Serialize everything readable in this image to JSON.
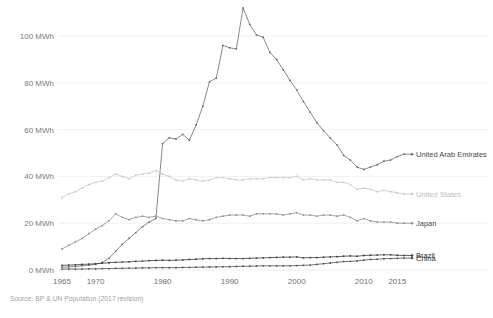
{
  "chart_data": {
    "type": "line",
    "title": "",
    "subtitle": "",
    "xlabel": "",
    "ylabel": "",
    "unit": "MWh",
    "xlim": [
      1965,
      2016
    ],
    "ylim": [
      0,
      112
    ],
    "grid": true,
    "legend_position": "right-inline",
    "source": "Source: BP & UN Population (2017 revision)",
    "y_ticks": [
      0,
      20,
      40,
      60,
      80,
      100
    ],
    "y_tick_labels": [
      "0 MWh",
      "20 MWh",
      "40 MWh",
      "60 MWh",
      "80 MWh",
      "100 MWh"
    ],
    "x_ticks": [
      1965,
      1970,
      1980,
      1990,
      2000,
      2010,
      2015
    ],
    "x_tick_labels": [
      "1965",
      "1970",
      "1980",
      "1990",
      "2000",
      "2010",
      "2015"
    ],
    "x": [
      1965,
      1966,
      1967,
      1968,
      1969,
      1970,
      1971,
      1972,
      1973,
      1974,
      1975,
      1976,
      1977,
      1978,
      1979,
      1980,
      1981,
      1982,
      1983,
      1984,
      1985,
      1986,
      1987,
      1988,
      1989,
      1990,
      1991,
      1992,
      1993,
      1994,
      1995,
      1996,
      1997,
      1998,
      1999,
      2000,
      2001,
      2002,
      2003,
      2004,
      2005,
      2006,
      2007,
      2008,
      2009,
      2010,
      2011,
      2012,
      2013,
      2014,
      2015,
      2016
    ],
    "series": [
      {
        "name": "United Arab Emirates",
        "color": "#6b6b6b",
        "label_color": "#4a4a4a",
        "values": [
          1.2,
          1.3,
          1.5,
          1.8,
          2.1,
          2.4,
          3.2,
          5.0,
          8.0,
          11.0,
          13.5,
          16.0,
          18.5,
          20.5,
          22.0,
          54.0,
          56.5,
          56.0,
          58.0,
          55.5,
          62.0,
          70.0,
          80.5,
          82.0,
          96.0,
          95.0,
          94.5,
          112.0,
          105.0,
          100.5,
          99.5,
          93.0,
          90.0,
          85.5,
          81.0,
          77.0,
          72.0,
          67.5,
          63.0,
          59.5,
          56.5,
          53.5,
          49.0,
          47.0,
          44.0,
          43.0,
          44.0,
          45.0,
          46.5,
          47.0,
          48.5,
          49.5
        ]
      },
      {
        "name": "United States",
        "color": "#c8c8c8",
        "label_color": "#c0c0c0",
        "values": [
          31.0,
          32.5,
          33.5,
          35.0,
          36.5,
          37.5,
          38.0,
          39.5,
          41.0,
          40.0,
          39.0,
          40.5,
          41.0,
          41.5,
          42.5,
          41.0,
          40.0,
          38.5,
          38.0,
          39.0,
          38.5,
          38.0,
          38.5,
          39.5,
          39.5,
          39.0,
          38.5,
          38.5,
          39.0,
          39.0,
          39.0,
          39.5,
          39.5,
          39.5,
          39.5,
          40.0,
          38.5,
          39.0,
          38.5,
          38.5,
          38.5,
          37.5,
          37.5,
          36.5,
          34.5,
          35.0,
          34.5,
          33.5,
          34.0,
          33.5,
          33.0,
          32.5
        ]
      },
      {
        "name": "Japan",
        "color": "#8f8f8f",
        "label_color": "#4a4a4a",
        "values": [
          9.0,
          10.5,
          12.0,
          13.5,
          15.5,
          17.5,
          19.0,
          21.0,
          24.0,
          22.5,
          21.5,
          22.5,
          23.0,
          22.5,
          23.0,
          22.0,
          21.5,
          21.0,
          21.0,
          22.0,
          21.5,
          21.0,
          21.5,
          22.5,
          23.0,
          23.5,
          23.5,
          23.5,
          23.0,
          24.0,
          24.0,
          24.0,
          24.0,
          23.5,
          24.0,
          24.5,
          23.5,
          23.5,
          23.0,
          23.5,
          23.5,
          23.0,
          23.5,
          22.5,
          21.0,
          22.0,
          21.0,
          20.5,
          20.5,
          20.5,
          20.0,
          20.0
        ]
      },
      {
        "name": "Brazil",
        "color": "#3c3c3c",
        "label_color": "#2e2e2e",
        "values": [
          2.0,
          2.1,
          2.2,
          2.4,
          2.5,
          2.7,
          2.9,
          3.1,
          3.3,
          3.4,
          3.5,
          3.7,
          3.8,
          4.0,
          4.1,
          4.2,
          4.1,
          4.2,
          4.3,
          4.5,
          4.6,
          4.8,
          4.9,
          4.9,
          5.0,
          4.9,
          4.9,
          4.9,
          5.0,
          5.1,
          5.2,
          5.3,
          5.4,
          5.5,
          5.5,
          5.6,
          5.2,
          5.3,
          5.3,
          5.5,
          5.6,
          5.7,
          5.9,
          6.0,
          5.9,
          6.2,
          6.3,
          6.4,
          6.5,
          6.5,
          6.3,
          6.2
        ]
      },
      {
        "name": "China",
        "color": "#4f4f4f",
        "label_color": "#2e2e2e",
        "values": [
          0.4,
          0.4,
          0.4,
          0.4,
          0.5,
          0.5,
          0.6,
          0.6,
          0.7,
          0.7,
          0.8,
          0.8,
          0.9,
          0.9,
          1.0,
          1.0,
          1.0,
          1.0,
          1.1,
          1.1,
          1.2,
          1.2,
          1.3,
          1.3,
          1.4,
          1.4,
          1.5,
          1.6,
          1.6,
          1.7,
          1.8,
          1.8,
          1.8,
          1.8,
          1.8,
          1.9,
          2.0,
          2.1,
          2.4,
          2.7,
          3.0,
          3.3,
          3.6,
          3.7,
          3.9,
          4.2,
          4.5,
          4.6,
          4.8,
          4.9,
          5.0,
          5.1
        ]
      }
    ],
    "legend_entries": [
      {
        "label": "United Arab Emirates",
        "color": "#4a4a4a"
      },
      {
        "label": "United States",
        "color": "#c0c0c0"
      },
      {
        "label": "Japan",
        "color": "#4a4a4a"
      },
      {
        "label": "Brazil",
        "color": "#2e2e2e"
      },
      {
        "label": "China",
        "color": "#2e2e2e"
      }
    ]
  }
}
